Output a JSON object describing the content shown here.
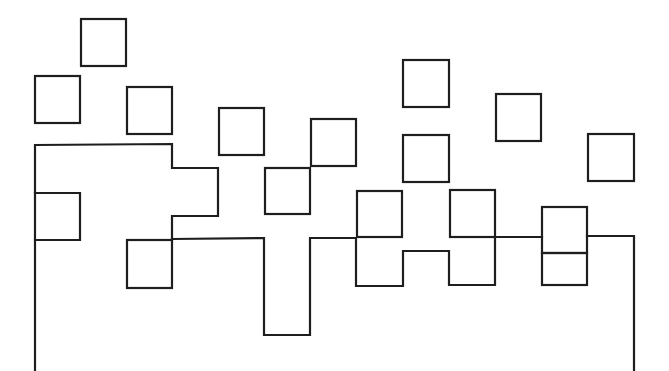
{
  "diagram": {
    "stroke_color": "#1e1e1e",
    "background_color": "#ffffff",
    "squares": [
      {
        "id": "sq-1",
        "x": 81,
        "y": 19,
        "w": 45,
        "h": 47
      },
      {
        "id": "sq-2",
        "x": 35,
        "y": 76,
        "w": 45,
        "h": 47
      },
      {
        "id": "sq-3",
        "x": 127,
        "y": 87,
        "w": 45,
        "h": 47
      },
      {
        "id": "sq-4",
        "x": 219,
        "y": 108,
        "w": 45,
        "h": 47
      },
      {
        "id": "sq-5",
        "x": 311,
        "y": 119,
        "w": 45,
        "h": 47
      },
      {
        "id": "sq-6",
        "x": 403,
        "y": 60,
        "w": 46,
        "h": 47
      },
      {
        "id": "sq-7",
        "x": 496,
        "y": 94,
        "w": 45,
        "h": 47
      },
      {
        "id": "sq-8",
        "x": 588,
        "y": 134,
        "w": 46,
        "h": 47
      },
      {
        "id": "sq-9",
        "x": 403,
        "y": 135,
        "w": 46,
        "h": 47
      },
      {
        "id": "sq-10",
        "x": 265,
        "y": 168,
        "w": 45,
        "h": 46
      },
      {
        "id": "sq-11",
        "x": 357,
        "y": 191,
        "w": 45,
        "h": 46
      },
      {
        "id": "sq-12",
        "x": 450,
        "y": 190,
        "w": 45,
        "h": 47
      },
      {
        "id": "sq-13",
        "x": 542,
        "y": 207,
        "w": 45,
        "h": 46
      },
      {
        "id": "sq-14",
        "x": 127,
        "y": 240,
        "w": 45,
        "h": 48
      },
      {
        "id": "sq-15",
        "x": 542,
        "y": 253,
        "w": 45,
        "h": 32
      }
    ],
    "outlines": [
      {
        "id": "upper-left-block",
        "points": [
          [
            35,
            240
          ],
          [
            35,
            193
          ],
          [
            80,
            193
          ],
          [
            80,
            240
          ],
          [
            35,
            240
          ]
        ]
      },
      {
        "id": "upper-left-step",
        "points": [
          [
            35,
            193
          ],
          [
            35,
            145
          ],
          [
            172,
            144
          ],
          [
            172,
            168
          ],
          [
            218,
            168
          ],
          [
            218,
            216
          ],
          [
            172,
            216
          ],
          [
            172,
            240
          ]
        ]
      },
      {
        "id": "main-outline",
        "points": [
          [
            35,
            240
          ],
          [
            35,
            371
          ]
        ]
      },
      {
        "id": "bottom-profile",
        "points": [
          [
            172,
            239
          ],
          [
            264,
            238
          ],
          [
            264,
            335
          ],
          [
            310,
            335
          ],
          [
            310,
            238
          ],
          [
            356,
            238
          ],
          [
            356,
            286
          ],
          [
            403,
            286
          ],
          [
            403,
            251
          ],
          [
            449,
            251
          ],
          [
            449,
            285
          ],
          [
            495,
            285
          ],
          [
            495,
            237
          ],
          [
            542,
            237
          ]
        ]
      },
      {
        "id": "right-edge",
        "points": [
          [
            587,
            236
          ],
          [
            634,
            236
          ],
          [
            634,
            371
          ]
        ]
      }
    ]
  }
}
